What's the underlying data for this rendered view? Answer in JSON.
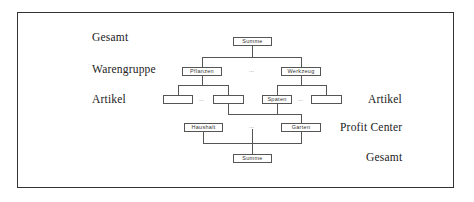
{
  "levels_left": [
    {
      "label": "Gesamt"
    },
    {
      "label": "Warengruppe"
    },
    {
      "label": "Artikel"
    }
  ],
  "levels_right": [
    {
      "label": "Artikel"
    },
    {
      "label": "Profit Center"
    },
    {
      "label": "Gesamt"
    }
  ],
  "nodes": {
    "top_summe": "Summe",
    "pflanzen": "Pflanzen",
    "werkzeug": "Werkzeug",
    "artikel_1": "",
    "artikel_2": "",
    "spaten": "Spaten",
    "artikel_4": "",
    "haushalt": "Haushalt",
    "garten": "Garten",
    "bottom_summe": "Summe"
  },
  "ellipsis": "..."
}
